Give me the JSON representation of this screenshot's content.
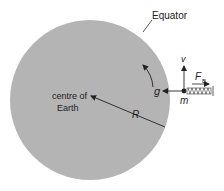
{
  "diagram": {
    "labels": {
      "equator": "Equator",
      "centre_line1": "centre of",
      "centre_line2": "Earth",
      "radius": "R",
      "gravity": "g",
      "velocity": "v",
      "force": "F",
      "force_sub": "B",
      "mass": "m"
    },
    "colors": {
      "earth": "#b4b4b4",
      "ink": "#222222"
    },
    "icons": {
      "spring": "spring-balance-icon",
      "rotation": "curved-arrow-icon"
    }
  }
}
